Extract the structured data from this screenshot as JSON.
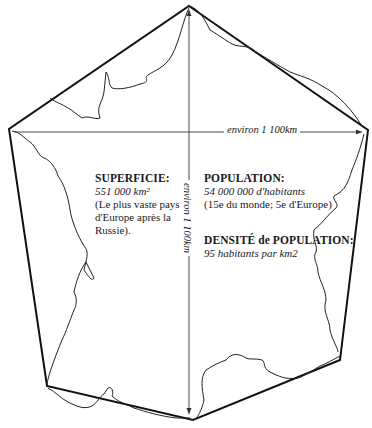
{
  "diagram": {
    "colors": {
      "outline": "#111111",
      "coast": "#222222",
      "arrow": "#333333",
      "background": "#ffffff"
    },
    "dimensions": {
      "horizontal_label": "environ 1 100km",
      "vertical_label": "environ 1 100km"
    },
    "superficie": {
      "heading": "SUPERFICIE:",
      "value": "551 000 km²",
      "note_lines": [
        "(Le plus vaste pays",
        "d'Europe après la",
        "Russie)."
      ]
    },
    "population": {
      "heading": "POPULATION:",
      "value": "54 000 000 d'habitants",
      "note": "(15e du monde; 5e d'Europe)"
    },
    "densite": {
      "heading_part1": "DENSITÉ",
      "heading_part2": " de ",
      "heading_part3": "POPULATION:",
      "value": "95 habitants par km2"
    }
  }
}
